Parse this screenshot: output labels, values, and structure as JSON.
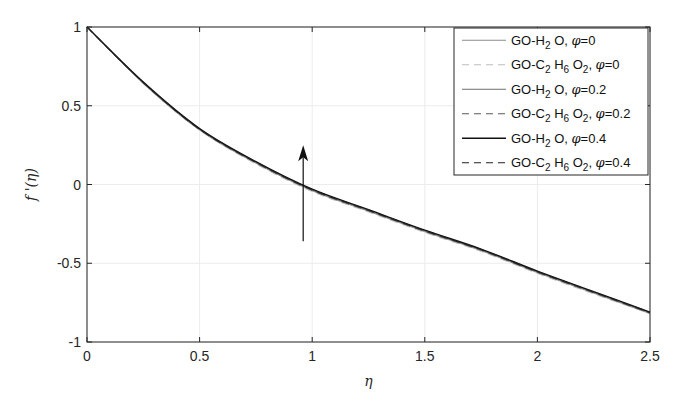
{
  "chart_data": {
    "type": "line",
    "title": "",
    "xlabel": "η",
    "ylabel": "f '(η)",
    "xlim": [
      0,
      2.5
    ],
    "ylim": [
      -1,
      1
    ],
    "xticks": [
      "0",
      "0.5",
      "1",
      "1.5",
      "2",
      "2.5"
    ],
    "yticks": [
      "1",
      "0.5",
      "0",
      "-0.5",
      "-1"
    ],
    "grid": true,
    "legend_position": "upper right",
    "x": [
      0,
      0.25,
      0.5,
      0.75,
      1.0,
      1.25,
      1.5,
      1.75,
      2.0,
      2.25,
      2.5
    ],
    "series": [
      {
        "name": "GO-H2O, φ=0",
        "label_parts": [
          "GO-H",
          "2",
          " O, ",
          "φ",
          "=0"
        ],
        "style": "solid",
        "color": "#8c8c8c",
        "width": 1,
        "values": [
          1.0,
          0.64,
          0.345,
          0.135,
          -0.04,
          -0.17,
          -0.3,
          -0.42,
          -0.56,
          -0.69,
          -0.82
        ]
      },
      {
        "name": "GO-C2H6O2, φ=0",
        "label_parts": [
          "GO-C",
          "2",
          " H",
          "6",
          " O",
          "2",
          ", ",
          "φ",
          "=0"
        ],
        "style": "dashed",
        "color": "#bdbdbd",
        "width": 1,
        "values": [
          1.0,
          0.64,
          0.345,
          0.13,
          -0.045,
          -0.175,
          -0.305,
          -0.425,
          -0.565,
          -0.695,
          -0.82
        ]
      },
      {
        "name": "GO-H2O, φ=0.2",
        "label_parts": [
          "GO-H",
          "2",
          " O, ",
          "φ",
          "=0.2"
        ],
        "style": "solid",
        "color": "#6e6e6e",
        "width": 1,
        "values": [
          1.0,
          0.645,
          0.35,
          0.14,
          -0.035,
          -0.165,
          -0.295,
          -0.415,
          -0.555,
          -0.685,
          -0.815
        ]
      },
      {
        "name": "GO-C2H6O2, φ=0.2",
        "label_parts": [
          "GO-C",
          "2",
          " H",
          "6",
          " O",
          "2",
          ", ",
          "φ",
          "=0.2"
        ],
        "style": "dashed",
        "color": "#5a5a5a",
        "width": 1,
        "values": [
          1.0,
          0.645,
          0.348,
          0.137,
          -0.038,
          -0.168,
          -0.298,
          -0.418,
          -0.558,
          -0.688,
          -0.817
        ]
      },
      {
        "name": "GO-H2O, φ=0.4",
        "label_parts": [
          "GO-H",
          "2",
          " O, ",
          "φ",
          "=0.4"
        ],
        "style": "solid",
        "color": "#111111",
        "width": 1.4,
        "values": [
          1.0,
          0.65,
          0.355,
          0.145,
          -0.03,
          -0.16,
          -0.29,
          -0.41,
          -0.55,
          -0.68,
          -0.81
        ]
      },
      {
        "name": "GO-C2H6O2, φ=0.4",
        "label_parts": [
          "GO-C",
          "2",
          " H",
          "6",
          " O",
          "2",
          ", ",
          "φ",
          "=0.4"
        ],
        "style": "dashed",
        "color": "#222222",
        "width": 1.2,
        "values": [
          1.0,
          0.648,
          0.352,
          0.142,
          -0.033,
          -0.163,
          -0.293,
          -0.413,
          -0.553,
          -0.683,
          -0.812
        ]
      }
    ],
    "annotations": [
      {
        "type": "arrow",
        "x": 0.96,
        "y_from": -0.36,
        "y_to": 0.25,
        "meaning": "increasing φ"
      }
    ]
  },
  "layout": {
    "plot": {
      "left": 87,
      "top": 27,
      "right": 650,
      "bottom": 342
    },
    "legend": {
      "left": 454,
      "top": 28,
      "right": 648,
      "bottom": 175
    }
  }
}
